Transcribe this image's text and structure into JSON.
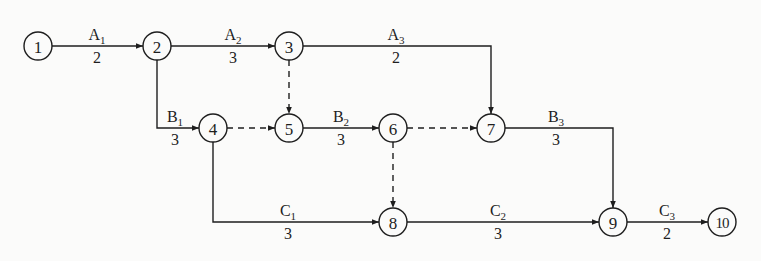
{
  "diagram": {
    "type": "activity-on-arrow network",
    "colors": {
      "background": "#fbfbfa",
      "stroke": "#1e1e1e"
    },
    "nodes": [
      {
        "id": "1",
        "label": "1",
        "x": 38,
        "y": 46
      },
      {
        "id": "2",
        "label": "2",
        "x": 157,
        "y": 46
      },
      {
        "id": "3",
        "label": "3",
        "x": 289,
        "y": 46
      },
      {
        "id": "4",
        "label": "4",
        "x": 213,
        "y": 128
      },
      {
        "id": "5",
        "label": "5",
        "x": 289,
        "y": 128
      },
      {
        "id": "6",
        "label": "6",
        "x": 393,
        "y": 128
      },
      {
        "id": "7",
        "label": "7",
        "x": 491,
        "y": 128
      },
      {
        "id": "8",
        "label": "8",
        "x": 393,
        "y": 222
      },
      {
        "id": "9",
        "label": "9",
        "x": 613,
        "y": 222
      },
      {
        "id": "10",
        "label": "10",
        "x": 722,
        "y": 222
      }
    ],
    "activities": [
      {
        "name": "A",
        "sub": "1",
        "duration": "2",
        "from": "1",
        "to": "2",
        "labelX": 97,
        "labelY": 46
      },
      {
        "name": "A",
        "sub": "2",
        "duration": "3",
        "from": "2",
        "to": "3",
        "labelX": 233,
        "labelY": 46
      },
      {
        "name": "A",
        "sub": "3",
        "duration": "2",
        "from": "3",
        "to": "7",
        "labelX": 396,
        "labelY": 46
      },
      {
        "name": "B",
        "sub": "1",
        "duration": "3",
        "from": "2",
        "to": "4",
        "labelX": 175,
        "labelY": 128
      },
      {
        "name": "B",
        "sub": "2",
        "duration": "3",
        "from": "5",
        "to": "6",
        "labelX": 341,
        "labelY": 128
      },
      {
        "name": "B",
        "sub": "3",
        "duration": "3",
        "from": "7",
        "to": "9",
        "labelX": 556,
        "labelY": 128
      },
      {
        "name": "C",
        "sub": "1",
        "duration": "3",
        "from": "4",
        "to": "8",
        "labelX": 288,
        "labelY": 222
      },
      {
        "name": "C",
        "sub": "2",
        "duration": "3",
        "from": "8",
        "to": "9",
        "labelX": 498,
        "labelY": 222
      },
      {
        "name": "C",
        "sub": "3",
        "duration": "2",
        "from": "9",
        "to": "10",
        "labelX": 667,
        "labelY": 222
      }
    ],
    "dummy_activities": [
      {
        "from": "3",
        "to": "5"
      },
      {
        "from": "4",
        "to": "5"
      },
      {
        "from": "6",
        "to": "7"
      },
      {
        "from": "6",
        "to": "8"
      }
    ]
  }
}
